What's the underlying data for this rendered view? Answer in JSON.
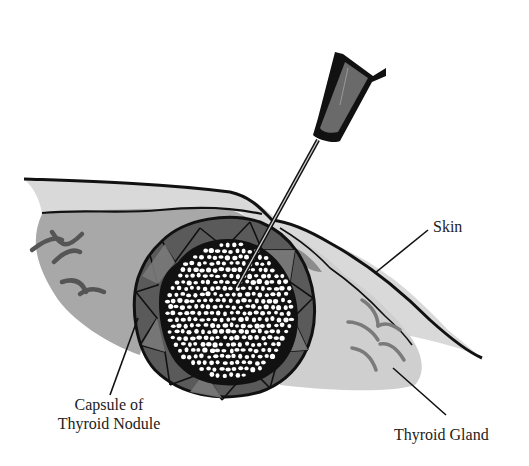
{
  "figure": {
    "labels": {
      "skin": "Skin",
      "capsule_line1": "Capsule of",
      "capsule_line2": "Thyroid Nodule",
      "gland": "Thyroid Gland"
    },
    "colors": {
      "background": "#ffffff",
      "outline": "#111111",
      "skin_fill": "#d9d9d9",
      "gland_left_fill": "#a6a6a6",
      "gland_right_fill": "#cfcfcf",
      "capsule_fill": "#555555",
      "capsule_segment": "#767676",
      "nodule_core": "#111111",
      "cells": "#ffffff",
      "vessel_dark": "#5a5a5a",
      "vessel_light": "#8a8a8a",
      "needle_hub": "#6a6a6a"
    },
    "icons": [
      "needle-icon",
      "syringe-hub-icon"
    ]
  }
}
